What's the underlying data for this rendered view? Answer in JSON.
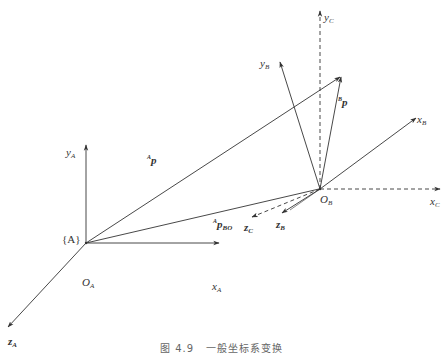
{
  "figure": {
    "caption_number": "图 4.9",
    "caption_text": "一般坐标系变换",
    "colors": {
      "line": "#333333",
      "label": "#333333",
      "caption": "#666666",
      "background": "#ffffff"
    }
  },
  "labels": {
    "yA": {
      "base": "y",
      "sub": "A"
    },
    "xA": {
      "base": "x",
      "sub": "A"
    },
    "zA": {
      "base": "z",
      "sub": "A"
    },
    "OA": {
      "base": "O",
      "sub": "A"
    },
    "frameA": "{A}",
    "Ap": {
      "sup": "A",
      "base": "p"
    },
    "ApBO": {
      "sup": "A",
      "base": "p",
      "sub": "BO"
    },
    "Bp": {
      "sup": "B",
      "base": "p"
    },
    "yB": {
      "base": "y",
      "sub": "B"
    },
    "xB": {
      "base": "x",
      "sub": "B"
    },
    "zB": {
      "base": "z",
      "sub": "B"
    },
    "OB": {
      "base": "O",
      "sub": "B"
    },
    "yC": {
      "base": "y",
      "sub": "C"
    },
    "xC": {
      "base": "x",
      "sub": "C"
    },
    "zC": {
      "base": "z",
      "sub": "C"
    }
  },
  "geometry": {
    "OA": [
      86,
      243
    ],
    "OB": [
      320,
      189
    ],
    "point_p": [
      341,
      76
    ]
  }
}
